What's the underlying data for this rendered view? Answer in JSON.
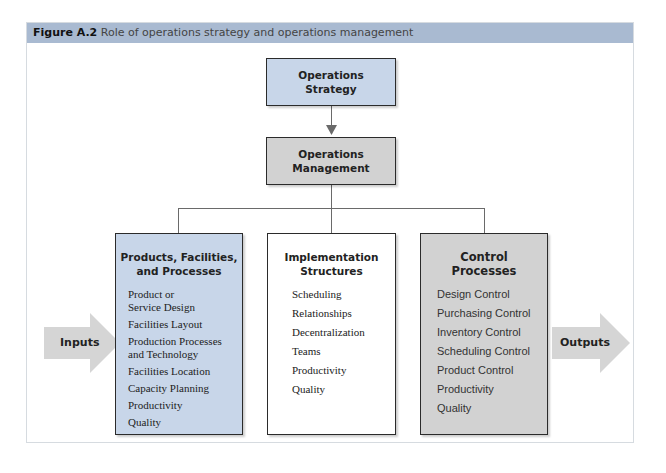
{
  "figure": {
    "label": "Figure A.2",
    "caption": "Role of operations strategy and operations management"
  },
  "nodes": {
    "strategy": {
      "line1": "Operations",
      "line2": "Strategy",
      "fill": "#c8d6e9"
    },
    "management": {
      "line1": "Operations",
      "line2": "Management",
      "fill": "#d2d2d2"
    },
    "products": {
      "title1": "Products, Facilities,",
      "title2": "and Processes",
      "fill": "#c8d6e9",
      "items": [
        "Product or\nService Design",
        "Facilities Layout",
        "Production Processes\nand Technology",
        "Facilities Location",
        "Capacity Planning",
        "Productivity",
        "Quality"
      ]
    },
    "implementation": {
      "title1": "Implementation",
      "title2": "Structures",
      "fill": "#ffffff",
      "items": [
        "Scheduling",
        "Relationships",
        "Decentralization",
        "Teams",
        "Productivity",
        "Quality"
      ]
    },
    "control": {
      "title1": "Control",
      "title2": "Processes",
      "fill": "#d2d2d2",
      "items": [
        "Design Control",
        "Purchasing Control",
        "Inventory Control",
        "Scheduling Control",
        "Product Control",
        "Productivity",
        "Quality"
      ]
    }
  },
  "arrows": {
    "inputs": "Inputs",
    "outputs": "Outputs",
    "fill": "#d5d5d5"
  },
  "colors": {
    "header_bar": "#a9bad1",
    "line": "#6a6a6a"
  }
}
